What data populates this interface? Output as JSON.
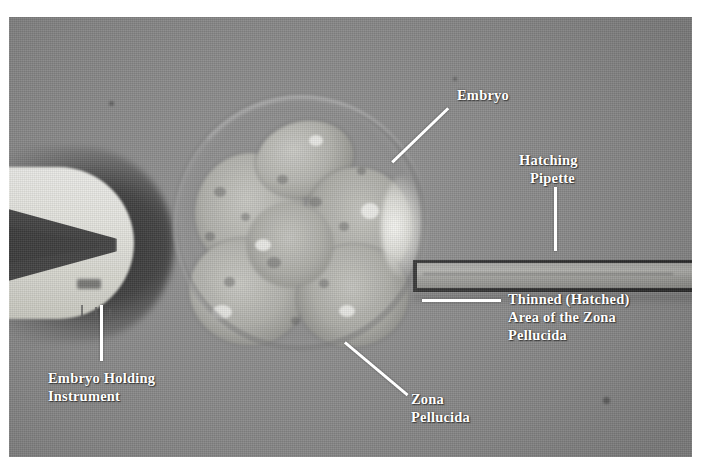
{
  "figure": {
    "type": "light-microscopy-photograph",
    "background_color": "#8b8b8b",
    "label_color": "#ffffff",
    "plate_border_color": "#ffffff"
  },
  "annotations": [
    {
      "id": "embryo",
      "lines": [
        "Embryo"
      ],
      "text": "Embryo",
      "leader": "diagonal",
      "points_to": "blastomere mass inside the zona pellucida"
    },
    {
      "id": "hatching-pipette",
      "lines": [
        "Hatching",
        "Pipette"
      ],
      "line1": "Hatching",
      "line2": "Pipette",
      "leader": "vertical",
      "points_to": "glass micro-pipette entering from the right"
    },
    {
      "id": "thinned-zona",
      "lines": [
        "Thinned (Hatched)",
        "Area of the Zona",
        "Pellucida"
      ],
      "line1": "Thinned (Hatched)",
      "line2": "Area of the Zona",
      "line3": "Pellucida",
      "leader": "horizontal",
      "points_to": "breached region of the zona pellucida"
    },
    {
      "id": "zona-pellucida",
      "lines": [
        "Zona",
        "Pellucida"
      ],
      "line1": "Zona",
      "line2": "Pellucida",
      "leader": "diagonal",
      "points_to": "outer glycoprotein shell of the embryo"
    },
    {
      "id": "embryo-holding-instrument",
      "lines": [
        "Embryo Holding",
        "Instrument"
      ],
      "line1": "Embryo Holding",
      "line2": "Instrument",
      "leader": "vertical",
      "points_to": "suction holding pipette at the left"
    }
  ]
}
